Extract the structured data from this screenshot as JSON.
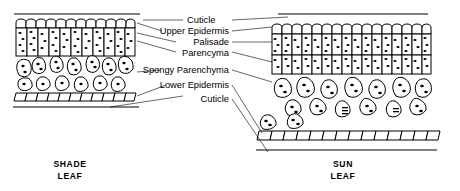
{
  "diagram": {
    "labels": [
      {
        "id": "cuticle-top",
        "text": "Cuticle"
      },
      {
        "id": "upper-epidermis",
        "text": "Upper Epidermis"
      },
      {
        "id": "palisade",
        "text": "Palisade"
      },
      {
        "id": "parencyma",
        "text": "Parencyma"
      },
      {
        "id": "spongy-parenchyma",
        "text": "Spongy Parenchyma"
      },
      {
        "id": "lower-epidermis",
        "text": "Lower Epidermis"
      },
      {
        "id": "cuticle-bottom",
        "text": "Cuticle"
      }
    ],
    "captions": [
      {
        "id": "shade",
        "line1": "SHADE",
        "line2": "LEAF"
      },
      {
        "id": "sun",
        "line1": "SUN",
        "line2": "LEAF"
      }
    ],
    "colors": {
      "ink": "#000000",
      "background": "#ffffff",
      "cell_fill": "#ffffff"
    }
  }
}
